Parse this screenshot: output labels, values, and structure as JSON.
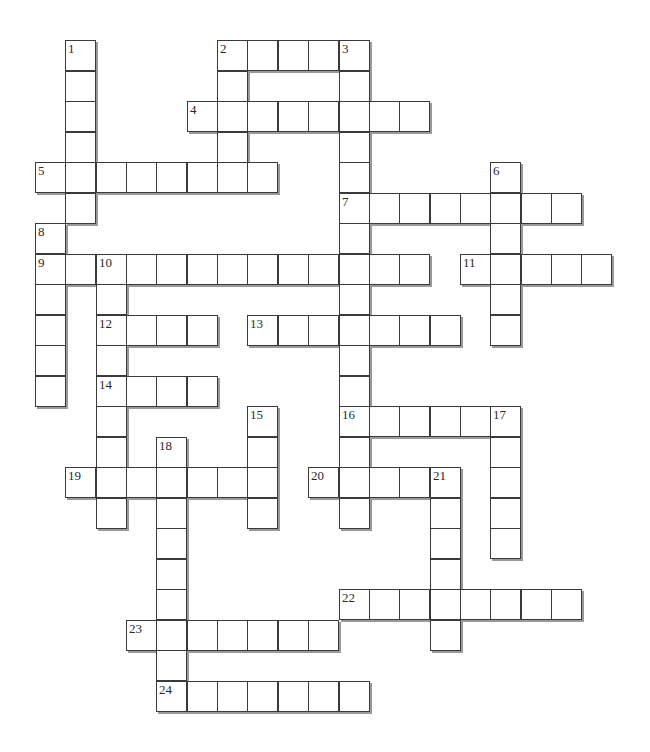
{
  "puzzle": {
    "type": "crossword",
    "grid": {
      "origin_x": 35,
      "origin_y": 40,
      "cell_w": 30.35,
      "cell_h": 30.5,
      "border_color": "#3a3a3a",
      "shadow_color": "#9a9a9a",
      "background": "#ffffff"
    },
    "words": [
      {
        "number": 1,
        "direction": "down",
        "row": 0,
        "col": 1,
        "length": 6
      },
      {
        "number": 2,
        "direction": "across",
        "row": 0,
        "col": 6,
        "length": 5
      },
      {
        "number": 2,
        "direction": "down",
        "row": 0,
        "col": 6,
        "length": 5
      },
      {
        "number": 3,
        "direction": "down",
        "row": 0,
        "col": 10,
        "length": 16
      },
      {
        "number": 4,
        "direction": "across",
        "row": 2,
        "col": 5,
        "length": 8
      },
      {
        "number": 5,
        "direction": "across",
        "row": 4,
        "col": 0,
        "length": 8
      },
      {
        "number": 6,
        "direction": "down",
        "row": 4,
        "col": 15,
        "length": 6
      },
      {
        "number": 7,
        "direction": "across",
        "row": 5,
        "col": 10,
        "length": 8
      },
      {
        "number": 8,
        "direction": "down",
        "row": 6,
        "col": 0,
        "length": 6
      },
      {
        "number": 9,
        "direction": "across",
        "row": 7,
        "col": 0,
        "length": 13
      },
      {
        "number": 10,
        "direction": "down",
        "row": 7,
        "col": 2,
        "length": 9
      },
      {
        "number": 11,
        "direction": "across",
        "row": 7,
        "col": 14,
        "length": 5
      },
      {
        "number": 12,
        "direction": "across",
        "row": 9,
        "col": 2,
        "length": 4
      },
      {
        "number": 13,
        "direction": "across",
        "row": 9,
        "col": 7,
        "length": 7
      },
      {
        "number": 14,
        "direction": "across",
        "row": 11,
        "col": 2,
        "length": 4
      },
      {
        "number": 15,
        "direction": "down",
        "row": 12,
        "col": 7,
        "length": 4
      },
      {
        "number": 16,
        "direction": "across",
        "row": 12,
        "col": 10,
        "length": 6
      },
      {
        "number": 17,
        "direction": "down",
        "row": 12,
        "col": 15,
        "length": 5
      },
      {
        "number": 18,
        "direction": "down",
        "row": 13,
        "col": 4,
        "length": 9
      },
      {
        "number": 19,
        "direction": "across",
        "row": 14,
        "col": 1,
        "length": 7
      },
      {
        "number": 20,
        "direction": "across",
        "row": 14,
        "col": 9,
        "length": 5
      },
      {
        "number": 21,
        "direction": "down",
        "row": 14,
        "col": 13,
        "length": 6
      },
      {
        "number": 22,
        "direction": "across",
        "row": 18,
        "col": 10,
        "length": 8
      },
      {
        "number": 23,
        "direction": "across",
        "row": 19,
        "col": 3,
        "length": 7
      },
      {
        "number": 24,
        "direction": "across",
        "row": 21,
        "col": 4,
        "length": 7
      }
    ],
    "numbered_cells": [
      {
        "label": "1",
        "row": 0,
        "col": 1
      },
      {
        "label": "2",
        "row": 0,
        "col": 6
      },
      {
        "label": "3",
        "row": 0,
        "col": 10
      },
      {
        "label": "4",
        "row": 2,
        "col": 5
      },
      {
        "label": "5",
        "row": 4,
        "col": 0
      },
      {
        "label": "6",
        "row": 4,
        "col": 15
      },
      {
        "label": "7",
        "row": 5,
        "col": 10
      },
      {
        "label": "8",
        "row": 6,
        "col": 0
      },
      {
        "label": "9",
        "row": 7,
        "col": 0
      },
      {
        "label": "10",
        "row": 7,
        "col": 2
      },
      {
        "label": "11",
        "row": 7,
        "col": 14
      },
      {
        "label": "12",
        "row": 9,
        "col": 2
      },
      {
        "label": "13",
        "row": 9,
        "col": 7
      },
      {
        "label": "14",
        "row": 11,
        "col": 2
      },
      {
        "label": "15",
        "row": 12,
        "col": 7
      },
      {
        "label": "16",
        "row": 12,
        "col": 10
      },
      {
        "label": "17",
        "row": 12,
        "col": 15
      },
      {
        "label": "18",
        "row": 13,
        "col": 4
      },
      {
        "label": "19",
        "row": 14,
        "col": 1
      },
      {
        "label": "20",
        "row": 14,
        "col": 9
      },
      {
        "label": "21",
        "row": 14,
        "col": 13
      },
      {
        "label": "22",
        "row": 18,
        "col": 10
      },
      {
        "label": "23",
        "row": 19,
        "col": 3
      },
      {
        "label": "24",
        "row": 21,
        "col": 4
      }
    ]
  }
}
